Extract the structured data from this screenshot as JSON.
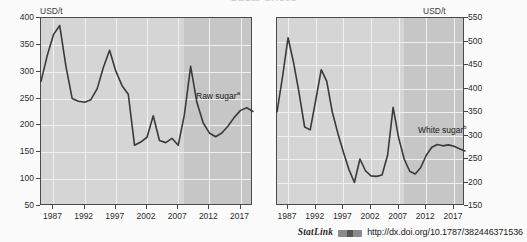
{
  "figure": {
    "clipped_title": "Sugar prices",
    "background_color": "#fbfbfb",
    "plot_color": "#d5d5d5",
    "projection_shade_color": "#c6c6c6",
    "line_color": "#3a3a3a"
  },
  "footer": {
    "statlink_label": "StatLink",
    "logo_name": "statlink-barcode-logo",
    "url": "http://dx.doi.org/10.1787/382446371536"
  },
  "chart_data": [
    {
      "type": "line",
      "panel": "left",
      "title": "",
      "ylabel": "USD/t",
      "xlabel": "",
      "ylim": [
        50,
        400
      ],
      "yticks": [
        50,
        100,
        150,
        200,
        250,
        300,
        350,
        400
      ],
      "xlim": [
        1985,
        2019
      ],
      "xticks": [
        1987,
        1992,
        1997,
        2002,
        2007,
        2012,
        2017
      ],
      "grid": true,
      "legend_position": "inline-right",
      "annotations": [
        {
          "text": "Raw sugar",
          "superscript": "a",
          "x": 2011,
          "y": 253
        }
      ],
      "projection_start": 2008,
      "series": [
        {
          "name": "Raw sugar",
          "x": [
            1985,
            1986,
            1987,
            1988,
            1989,
            1990,
            1991,
            1992,
            1993,
            1994,
            1995,
            1996,
            1997,
            1998,
            1999,
            2000,
            2001,
            2002,
            2003,
            2004,
            2005,
            2006,
            2007,
            2008,
            2009,
            2010,
            2011,
            2012,
            2013,
            2014,
            2015,
            2016,
            2017,
            2018,
            2019
          ],
          "values": [
            282,
            330,
            369,
            386,
            310,
            250,
            245,
            243,
            248,
            268,
            308,
            340,
            301,
            274,
            258,
            163,
            169,
            178,
            218,
            172,
            168,
            176,
            163,
            220,
            310,
            243,
            205,
            186,
            179,
            186,
            199,
            215,
            228,
            233,
            226,
            228,
            225,
            222,
            217
          ]
        }
      ]
    },
    {
      "type": "line",
      "panel": "right",
      "title": "",
      "ylabel": "USD/t",
      "xlabel": "",
      "ylim": [
        150,
        550
      ],
      "yticks": [
        150,
        200,
        250,
        300,
        350,
        400,
        450,
        500,
        550
      ],
      "xlim": [
        1985,
        2019
      ],
      "xticks": [
        1987,
        1992,
        1997,
        2002,
        2007,
        2012,
        2017
      ],
      "grid": true,
      "legend_position": "inline-right",
      "annotations": [
        {
          "text": "White sugar",
          "superscript": "b",
          "x": 2011,
          "y": 300
        }
      ],
      "projection_start": 2008,
      "series": [
        {
          "name": "White sugar",
          "x": [
            1985,
            1986,
            1987,
            1988,
            1989,
            1990,
            1991,
            1992,
            1993,
            1994,
            1995,
            1996,
            1997,
            1998,
            1999,
            2000,
            2001,
            2002,
            2003,
            2004,
            2005,
            2006,
            2007,
            2008,
            2009,
            2010,
            2011,
            2012,
            2013,
            2014,
            2015,
            2016,
            2017,
            2018,
            2019
          ],
          "values": [
            350,
            425,
            508,
            455,
            390,
            318,
            312,
            375,
            440,
            415,
            350,
            305,
            265,
            228,
            200,
            250,
            225,
            214,
            213,
            216,
            258,
            360,
            295,
            250,
            224,
            218,
            232,
            258,
            275,
            281,
            278,
            280,
            277,
            272,
            267
          ]
        }
      ]
    }
  ],
  "left_axis": {
    "unit": "USD/t",
    "yticks": [
      "400",
      "350",
      "300",
      "250",
      "200",
      "150",
      "100",
      "50"
    ],
    "xticks": [
      "1987",
      "1992",
      "1997",
      "2002",
      "2007",
      "2012",
      "2017"
    ],
    "series_label": "Raw sugar",
    "series_superscript": "a"
  },
  "right_axis": {
    "unit": "USD/t",
    "yticks": [
      "550",
      "500",
      "450",
      "400",
      "350",
      "300",
      "250",
      "200",
      "150"
    ],
    "xticks": [
      "1987",
      "1992",
      "1997",
      "2002",
      "2007",
      "2012",
      "2017"
    ],
    "series_label": "White sugar",
    "series_superscript": "b"
  }
}
